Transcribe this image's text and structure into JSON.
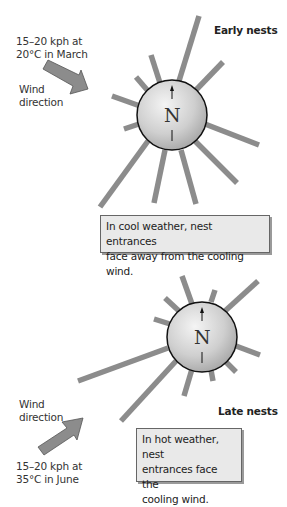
{
  "early": {
    "title": "Early nests",
    "wind_speed_line1": "15–20 kph at",
    "wind_speed_line2": "20°C in March",
    "wind_label_line1": "Wind",
    "wind_label_line2": "direction",
    "compass_label": "N",
    "caption_line1": "In cool weather, nest entrances",
    "caption_line2": "face away from the cooling wind."
  },
  "late": {
    "title": "Late nests",
    "wind_speed_line1": "15–20 kph at",
    "wind_speed_line2": "35°C in June",
    "wind_label_line1": "Wind",
    "wind_label_line2": "direction",
    "compass_label": "N",
    "caption_line1": "In hot weather, nest",
    "caption_line2": "entrances face the",
    "caption_line3": "cooling wind."
  },
  "colors": {
    "tunnel": "#8a8a8a",
    "arrow": "#8a8a8a",
    "sphere_light": "#f2f2f2",
    "sphere_dark": "#a8a8a8",
    "caption_bg": "#e9e9e9"
  }
}
